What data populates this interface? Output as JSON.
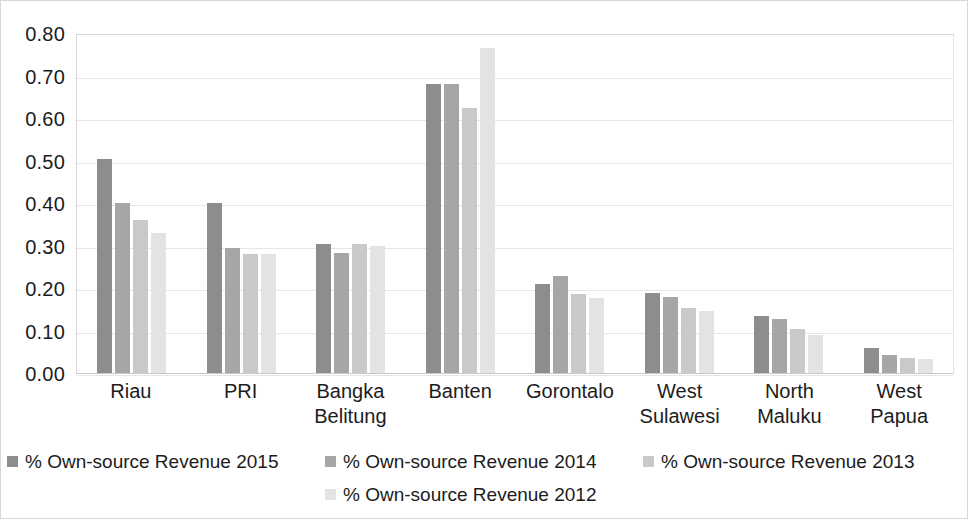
{
  "chart_data": {
    "type": "bar",
    "title": "",
    "subtitle": "",
    "xlabel": "",
    "ylabel": "",
    "ylim": [
      0.0,
      0.8
    ],
    "ytick_labels": [
      "0.80",
      "0.70",
      "0.60",
      "0.50",
      "0.40",
      "0.30",
      "0.20",
      "0.10",
      "0.00"
    ],
    "ytick_values": [
      0.8,
      0.7,
      0.6,
      0.5,
      0.4,
      0.3,
      0.2,
      0.1,
      0.0
    ],
    "grid": true,
    "legend_position": "bottom",
    "categories": [
      "Riau",
      "PRI",
      "Bangka Belitung",
      "Banten",
      "Gorontalo",
      "West Sulawesi",
      "North Maluku",
      "West Papua"
    ],
    "category_lines": [
      [
        "Riau"
      ],
      [
        "PRI"
      ],
      [
        "Bangka",
        "Belitung"
      ],
      [
        "Banten"
      ],
      [
        "Gorontalo"
      ],
      [
        "West",
        "Sulawesi"
      ],
      [
        "North",
        "Maluku"
      ],
      [
        "West",
        "Papua"
      ]
    ],
    "series": [
      {
        "name": "% Own-source Revenue 2015",
        "color": "#8d8d8d",
        "values": [
          0.503,
          0.401,
          0.303,
          0.68,
          0.21,
          0.188,
          0.135,
          0.058
        ]
      },
      {
        "name": "% Own-source Revenue 2014",
        "color": "#a6a6a6",
        "values": [
          0.4,
          0.294,
          0.283,
          0.679,
          0.228,
          0.178,
          0.128,
          0.042
        ]
      },
      {
        "name": "% Own-source Revenue 2013",
        "color": "#c9c9c9",
        "values": [
          0.361,
          0.279,
          0.303,
          0.624,
          0.185,
          0.152,
          0.104,
          0.036
        ]
      },
      {
        "name": "% Own-source Revenue 2012",
        "color": "#e3e3e3",
        "values": [
          0.33,
          0.28,
          0.3,
          0.765,
          0.176,
          0.146,
          0.09,
          0.033
        ]
      }
    ]
  }
}
